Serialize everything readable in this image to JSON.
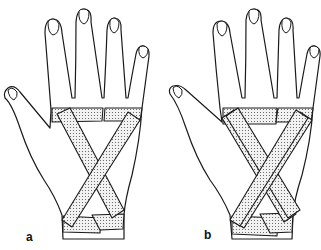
{
  "figure": {
    "panels": [
      {
        "label": "a",
        "description": "Hand dorsum with basic X-pattern tape strips and wrist/metacarpal anchor strips"
      },
      {
        "label": "b",
        "description": "Hand dorsum with reinforced layered X-pattern tape strips and anchors"
      }
    ],
    "colors": {
      "line": "#1a1a1a",
      "background": "#ffffff",
      "tape_fill": "#e6e6e6"
    }
  }
}
